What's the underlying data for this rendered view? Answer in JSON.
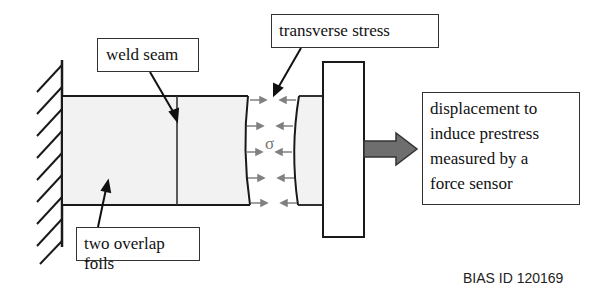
{
  "labels": {
    "weld_seam": "weld seam",
    "transverse_stress": "transverse stress",
    "two_overlap_foils": "two overlap foils",
    "displacement": {
      "lines": [
        "displacement to",
        "induce prestress",
        "measured by a",
        "force sensor"
      ]
    },
    "sigma": "σ"
  },
  "footer": {
    "id_text": "BIAS ID 120169"
  },
  "colors": {
    "foil_fill": "#f2f2f2",
    "outline": "#1a1a1a",
    "stress_arrows": "#808080",
    "force_arrow": "#6e6e6e"
  },
  "icons": {
    "fixed_wall": "hatched-wall-support",
    "force_arrow": "block-arrow-right"
  }
}
